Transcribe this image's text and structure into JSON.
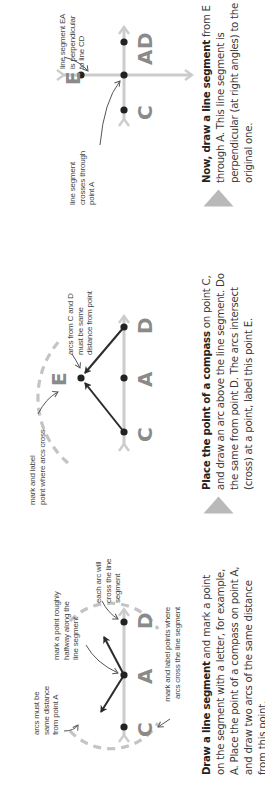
{
  "colors": {
    "construction_line": "#cccccc",
    "arc_dash": "#c4c4c4",
    "arrow": "#2b2b2b",
    "point": "#222222",
    "letter": "#8a8a8a",
    "step_triangle": "#b9b9b9"
  },
  "steps": [
    {
      "points": {
        "c": "C",
        "a": "A",
        "d": "D"
      },
      "annotations": {
        "arcs_same_distance": "arcs must be same distance from point A",
        "arcs_same_distance_lines": [
          "arcs must be",
          "same distance",
          "from point A"
        ],
        "halfway_lines": [
          "mark a point roughly",
          "halfway along the",
          "line segment"
        ],
        "each_arc_lines": [
          "each arc will",
          "cross the line",
          "segment"
        ],
        "mark_label_lines": [
          "mark and label points where",
          "arcs cross the line segment"
        ]
      },
      "caption": {
        "bold": "Draw a line segment",
        "rest": " and mark a point on the segment with a letter, for example, A. Place the point of a compass on point A, and draw two arcs of the same distance from this point."
      }
    },
    {
      "points": {
        "c": "C",
        "a": "A",
        "d": "D",
        "e": "E"
      },
      "annotations": {
        "mark_label_lines": [
          "mark and label",
          "point where arcs cross"
        ],
        "arcs_from_lines": [
          "arcs from C and D",
          "must be same",
          "distance from point"
        ]
      },
      "caption": {
        "bold": "Place the point of a compass",
        "rest": " on point C, and draw an arc above the line segment. Do the same from point D. The arcs intersect (cross) at a point, label this point E."
      }
    },
    {
      "points": {
        "c": "C",
        "a": "A",
        "d": "D",
        "e": "E"
      },
      "annotations": {
        "crosses_lines": [
          "line segment",
          "crosses through",
          "point A"
        ],
        "perpendicular_lines": [
          "line segment EA",
          "is perpendicular",
          "to line CD"
        ]
      },
      "caption": {
        "bold": "Now, draw a line segment",
        "rest": " from E through A. This line segment is perpendicular (at right angles) to the original one."
      }
    }
  ]
}
